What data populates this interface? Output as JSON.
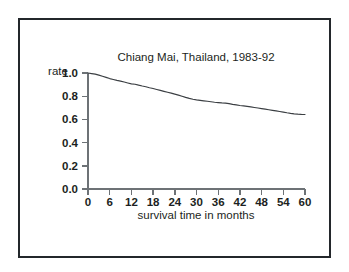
{
  "figure": {
    "frame_color": "#23272b",
    "background": "#ffffff",
    "line_color": "#3b3f43",
    "axis_color": "#6d7276"
  },
  "chart_data": {
    "type": "line",
    "title": "Chiang Mai, Thailand, 1983-92",
    "xlabel": "survival time in months",
    "ylabel": "rate",
    "xlim": [
      0,
      60
    ],
    "ylim": [
      0.0,
      1.0
    ],
    "grid": false,
    "legend": null,
    "xticks": [
      0,
      6,
      12,
      18,
      24,
      30,
      36,
      42,
      48,
      54,
      60
    ],
    "xtick_labels": [
      "0",
      "6",
      "12",
      "18",
      "24",
      "30",
      "36",
      "42",
      "48",
      "54",
      "60"
    ],
    "yticks": [
      0.0,
      0.2,
      0.4,
      0.6,
      0.8,
      1.0
    ],
    "ytick_labels": [
      "0.0",
      "0.2",
      "0.4",
      "0.6",
      "0.8",
      "1.0"
    ],
    "series": [
      {
        "name": "survival rate",
        "x": [
          0,
          1,
          2,
          3,
          4,
          5,
          6,
          7,
          8,
          9,
          10,
          11,
          12,
          13,
          14,
          15,
          16,
          17,
          18,
          19,
          20,
          21,
          22,
          23,
          24,
          25,
          26,
          27,
          28,
          29,
          30,
          31,
          32,
          33,
          34,
          35,
          36,
          37,
          38,
          39,
          40,
          41,
          42,
          43,
          44,
          45,
          46,
          47,
          48,
          49,
          50,
          51,
          52,
          53,
          54,
          55,
          56,
          57,
          58,
          59,
          60
        ],
        "values": [
          1.0,
          0.995,
          0.99,
          0.982,
          0.972,
          0.962,
          0.952,
          0.944,
          0.936,
          0.93,
          0.922,
          0.914,
          0.906,
          0.903,
          0.895,
          0.888,
          0.882,
          0.873,
          0.866,
          0.858,
          0.85,
          0.842,
          0.834,
          0.826,
          0.818,
          0.809,
          0.8,
          0.79,
          0.781,
          0.774,
          0.768,
          0.764,
          0.76,
          0.756,
          0.752,
          0.748,
          0.745,
          0.742,
          0.74,
          0.736,
          0.73,
          0.725,
          0.72,
          0.716,
          0.712,
          0.708,
          0.703,
          0.698,
          0.693,
          0.688,
          0.683,
          0.678,
          0.673,
          0.668,
          0.663,
          0.657,
          0.652,
          0.648,
          0.645,
          0.643,
          0.642
        ]
      }
    ]
  }
}
